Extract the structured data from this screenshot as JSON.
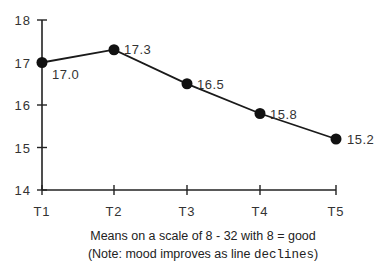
{
  "chart_data": {
    "type": "line",
    "title": "",
    "xlabel": "Means on a scale of 8 - 32 with 8 = good",
    "note_prefix": "(Note: mood improves as line ",
    "note_mono": "declines",
    "note_suffix": ")",
    "ylabel": "",
    "categories": [
      "T1",
      "T2",
      "T3",
      "T4",
      "T5"
    ],
    "series": [
      {
        "name": "Mood",
        "values": [
          17.0,
          17.3,
          16.5,
          15.8,
          15.2
        ]
      }
    ],
    "data_labels": [
      "17.0",
      "17.3",
      "16.5",
      "15.8",
      "15.2"
    ],
    "ylim": [
      14,
      18
    ],
    "yticks": [
      14,
      15,
      16,
      17,
      18
    ],
    "grid": false,
    "legend": "none",
    "colors": {
      "line": "#1a1a1a",
      "marker": "#111111",
      "axis": "#222222"
    }
  }
}
